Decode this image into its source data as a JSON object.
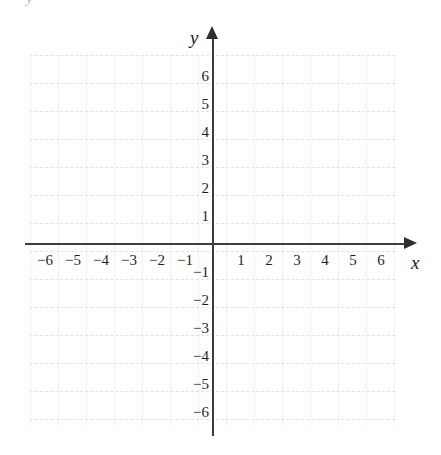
{
  "figure": {
    "kind": "blank-cartesian-grid",
    "top_artifact_text": "y",
    "axis_names": {
      "x": "x",
      "y": "y"
    }
  },
  "chart_data": {
    "type": "scatter",
    "title": "",
    "subtitle": "",
    "xlabel": "x",
    "ylabel": "y",
    "xlim": [
      -6.6,
      6.6
    ],
    "ylim": [
      -6.6,
      6.6
    ],
    "xticks": [
      -6,
      -5,
      -4,
      -3,
      -2,
      -1,
      1,
      2,
      3,
      4,
      5,
      6
    ],
    "yticks": [
      6,
      5,
      4,
      3,
      2,
      1,
      -1,
      -2,
      -3,
      -4,
      -5,
      -6
    ],
    "xticklabels": [
      "−6",
      "−5",
      "−4",
      "−3",
      "−2",
      "−1",
      "1",
      "2",
      "3",
      "4",
      "5",
      "6"
    ],
    "yticklabels": [
      "6",
      "5",
      "4",
      "3",
      "2",
      "1",
      "−1",
      "−2",
      "−3",
      "−4",
      "−5",
      "−6"
    ],
    "grid": true,
    "grid_spacing_units": 1,
    "legend": null,
    "legend_position": null,
    "series": [],
    "annotations": []
  },
  "colors": {
    "background": "#ffffff",
    "axis": "#3d3d3d",
    "arrowhead": "#2e2e2e",
    "gridline_horizontal": "#e2e2e2",
    "gridline_vertical": "#e4e4e4",
    "label_text": "#1f1f1f",
    "artifact_text": "#b9b9b9"
  },
  "geometry": {
    "canvas_width": 441,
    "canvas_height": 455,
    "origin_x": 213,
    "origin_y": 244,
    "unit_px": 28,
    "grid_left": 30,
    "grid_top": 55,
    "grid_width": 365,
    "grid_height": 370
  }
}
